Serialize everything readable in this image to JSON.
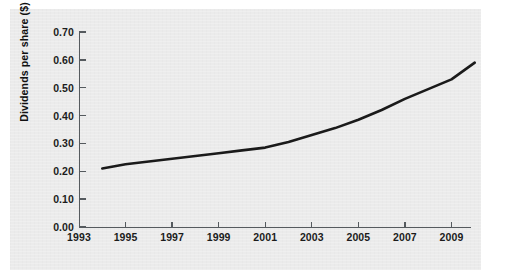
{
  "chart_data": {
    "type": "line",
    "title": "",
    "xlabel": "",
    "ylabel": "Dividends per share ($)",
    "xlim": [
      1993,
      1993
    ],
    "ylim": [
      0.0,
      0.7
    ],
    "grid": false,
    "legend": "none",
    "x_ticks": [
      "1993",
      "1995",
      "1997",
      "1999",
      "2001",
      "2003",
      "2005",
      "2007",
      "2009"
    ],
    "x_tick_values": [
      1993,
      1995,
      1997,
      1999,
      2001,
      2003,
      2005,
      2007,
      2009
    ],
    "y_ticks": [
      "0.00",
      "0.10",
      "0.20",
      "0.30",
      "0.40",
      "0.50",
      "0.60",
      "0.70"
    ],
    "y_tick_values": [
      0.0,
      0.1,
      0.2,
      0.3,
      0.4,
      0.5,
      0.6,
      0.7
    ],
    "series": [
      {
        "name": "Dividends per share",
        "color": "#1a1a1a",
        "x": [
          1994,
          1995,
          1996,
          1997,
          1998,
          1999,
          2000,
          2001,
          2002,
          2003,
          2004,
          2005,
          2006,
          2007,
          2008,
          2009,
          2010
        ],
        "values": [
          0.21,
          0.225,
          0.235,
          0.245,
          0.255,
          0.265,
          0.275,
          0.285,
          0.305,
          0.33,
          0.355,
          0.385,
          0.42,
          0.46,
          0.495,
          0.53,
          0.59
        ]
      }
    ],
    "axis_color": "#555a5e",
    "panel_color": "#ebebeb",
    "background_color": "#ffffff"
  }
}
